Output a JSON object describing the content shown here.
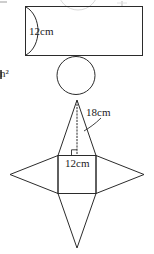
{
  "figure": {
    "stroke_color": "#2b2b2b",
    "faint_stroke_color": "#cfcfcf",
    "background_color": "#ffffff",
    "width": 154,
    "height": 254
  },
  "labels": {
    "cylinder_height": "12cm",
    "pyramid_slant_height": "18cm",
    "pyramid_base_edge": "12cm",
    "units_fragment": "n²"
  },
  "shapes": {
    "cylinder_net": {
      "name": "rectangle-with-arc",
      "rect": {
        "x": 25,
        "y": 6,
        "width": 118,
        "height": 50
      },
      "arc_note": "curved arc bulging right from top-left to bottom-left corner"
    },
    "circle": {
      "name": "circle-base",
      "cx": 76,
      "cy": 75,
      "r": 19
    },
    "pyramid_net": {
      "name": "square-pyramid-net",
      "square": {
        "x": 58,
        "y": 155,
        "width": 38,
        "height": 38
      },
      "top_triangle_apex": {
        "x": 77,
        "y": 100
      },
      "bottom_triangle_apex": {
        "x": 77,
        "y": 248
      },
      "left_triangle_apex": {
        "x": 10,
        "y": 174
      },
      "right_triangle_apex": {
        "x": 144,
        "y": 174
      },
      "dotted_altitude": "from apex (77,100) down to (77,155)",
      "right_angle_marker": {
        "x": 77,
        "y": 155
      },
      "leader_line": "curve from 18cm label to the right slant edge"
    }
  }
}
